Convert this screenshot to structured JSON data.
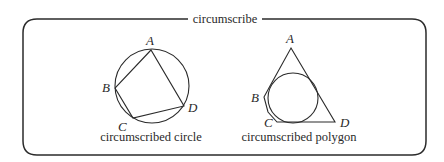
{
  "title": "circumscribe",
  "diagrams": [
    {
      "name": "circumscribed-circle",
      "caption": "circumscribed circle",
      "circle": {
        "cx": 152,
        "cy": 86,
        "r": 37
      },
      "vertices": {
        "A": {
          "label": "A",
          "point": [
            151,
            50
          ],
          "label_pos": [
            146,
            45
          ]
        },
        "B": {
          "label": "B",
          "point": [
            115,
            88
          ],
          "label_pos": [
            102,
            92
          ]
        },
        "C": {
          "label": "C",
          "point": [
            133,
            118
          ],
          "label_pos": [
            118,
            131
          ]
        },
        "D": {
          "label": "D",
          "point": [
            184,
            106
          ],
          "label_pos": [
            188,
            112
          ]
        }
      }
    },
    {
      "name": "circumscribed-polygon",
      "caption": "circumscribed polygon",
      "circle": {
        "cx": 293,
        "cy": 98,
        "r": 25
      },
      "vertices": {
        "A": {
          "label": "A",
          "point": [
            291,
            48
          ],
          "label_pos": [
            286,
            43
          ]
        },
        "B": {
          "label": "B",
          "point": [
            264,
            97
          ],
          "label_pos": [
            251,
            102
          ]
        },
        "C": {
          "label": "C",
          "point": [
            277,
            122
          ],
          "label_pos": [
            264,
            127
          ]
        },
        "D": {
          "label": "D",
          "point": [
            335,
            122
          ],
          "label_pos": [
            340,
            127
          ]
        }
      }
    }
  ],
  "colors": {
    "ink": "#2b2b2b",
    "background": "#ffffff"
  }
}
